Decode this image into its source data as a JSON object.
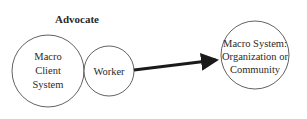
{
  "diagram": {
    "title": "Advocate",
    "nodes": [
      {
        "id": "macro-client-system",
        "lines": [
          "Macro",
          "Client",
          "System"
        ]
      },
      {
        "id": "worker",
        "lines": [
          "Worker"
        ]
      },
      {
        "id": "macro-system-target",
        "lines": [
          "Macro System:",
          "Organization or",
          "Community"
        ]
      }
    ],
    "edges": [
      {
        "from": "worker",
        "to": "macro-system-target",
        "style": "thick-arrow"
      }
    ],
    "colors": {
      "stroke": "#3a3a3a",
      "arrow": "#1a1a1a",
      "text": "#2a2a2a",
      "background": "#ffffff"
    }
  }
}
